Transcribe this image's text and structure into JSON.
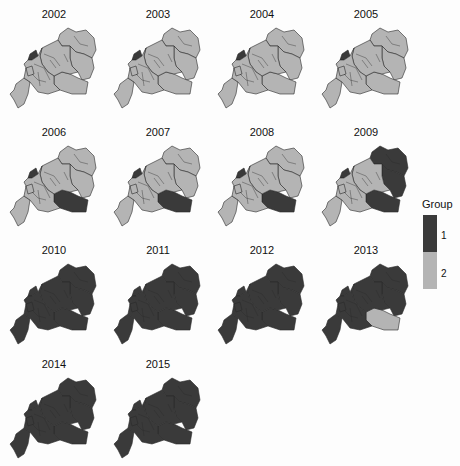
{
  "chart_data": {
    "type": "choropleth-small-multiples",
    "title": "",
    "legend": {
      "title": "Group",
      "entries": [
        {
          "label": "1",
          "color": "#3a3a3a"
        },
        {
          "label": "2",
          "color": "#b4b4b4"
        }
      ],
      "position": "right"
    },
    "regions": [
      "north-east",
      "east",
      "south-east",
      "central",
      "west-coast",
      "west-small",
      "south-west",
      "other"
    ],
    "panels": [
      {
        "year": "2002",
        "group1_regions": [
          "west-coast"
        ]
      },
      {
        "year": "2003",
        "group1_regions": [
          "west-coast"
        ]
      },
      {
        "year": "2004",
        "group1_regions": [
          "west-coast"
        ]
      },
      {
        "year": "2005",
        "group1_regions": [
          "west-coast"
        ]
      },
      {
        "year": "2006",
        "group1_regions": [
          "west-coast",
          "south-east"
        ]
      },
      {
        "year": "2007",
        "group1_regions": [
          "west-coast",
          "south-east"
        ]
      },
      {
        "year": "2008",
        "group1_regions": [
          "west-coast",
          "south-east"
        ]
      },
      {
        "year": "2009",
        "group1_regions": [
          "west-coast",
          "south-east",
          "north-east",
          "east"
        ]
      },
      {
        "year": "2010",
        "group1_regions": [
          "all-except-west-small"
        ]
      },
      {
        "year": "2011",
        "group1_regions": [
          "all"
        ]
      },
      {
        "year": "2012",
        "group1_regions": [
          "all"
        ]
      },
      {
        "year": "2013",
        "group1_regions": [
          "all-except-south-east"
        ]
      },
      {
        "year": "2014",
        "group1_regions": [
          "all"
        ]
      },
      {
        "year": "2015",
        "group1_regions": [
          "all"
        ]
      }
    ]
  },
  "colors": {
    "group1": "#3a3a3a",
    "group2": "#b4b4b4",
    "border": "#2a2a2a"
  },
  "legend": {
    "title": "Group",
    "label1": "1",
    "label2": "2"
  }
}
